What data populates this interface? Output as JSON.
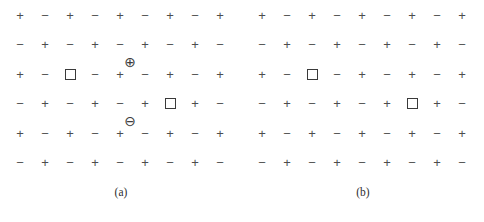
{
  "figure": {
    "background_color": "#ffffff",
    "glyph_color": "#4d4d4d",
    "marker_color": "#3a3a3a",
    "columns": 9,
    "rows": 6,
    "symbols": {
      "plus": "+",
      "minus": "−",
      "square": "□",
      "circled_plus": "⊕",
      "circled_minus": "⊖"
    }
  },
  "panels": [
    {
      "id": "a",
      "caption": "(a)",
      "grid": [
        [
          "+",
          "−",
          "+",
          "−",
          "+",
          "−",
          "+",
          "−",
          "+"
        ],
        [
          "−",
          "+",
          "−",
          "+",
          "−",
          "+",
          "−",
          "+",
          "−"
        ],
        [
          "+",
          "−",
          "□",
          "−",
          "+",
          "−",
          "+",
          "−",
          "+"
        ],
        [
          "−",
          "+",
          "−",
          "+",
          "−",
          "+",
          "□",
          "+",
          "−"
        ],
        [
          "+",
          "−",
          "+",
          "−",
          "+",
          "−",
          "+",
          "−",
          "+"
        ],
        [
          "−",
          "+",
          "−",
          "+",
          "−",
          "+",
          "−",
          "+",
          "−"
        ]
      ],
      "squares": [
        {
          "row": 3,
          "col": 3
        },
        {
          "row": 4,
          "col": 7
        }
      ],
      "defects": [
        {
          "kind": "circled-plus",
          "glyph": "⊕",
          "x": 130,
          "y": 62
        },
        {
          "kind": "circled-minus",
          "glyph": "⊖",
          "x": 130,
          "y": 121
        }
      ]
    },
    {
      "id": "b",
      "caption": "(b)",
      "grid": [
        [
          "+",
          "−",
          "+",
          "−",
          "+",
          "−",
          "+",
          "−",
          "+"
        ],
        [
          "−",
          "+",
          "−",
          "+",
          "−",
          "+",
          "−",
          "+",
          "−"
        ],
        [
          "+",
          "−",
          "□",
          "−",
          "+",
          "−",
          "+",
          "−",
          "+"
        ],
        [
          "−",
          "+",
          "−",
          "+",
          "−",
          "+",
          "□",
          "+",
          "−"
        ],
        [
          "+",
          "−",
          "+",
          "−",
          "+",
          "−",
          "+",
          "−",
          "+"
        ],
        [
          "−",
          "+",
          "−",
          "+",
          "−",
          "+",
          "−",
          "+",
          "−"
        ]
      ],
      "squares": [
        {
          "row": 3,
          "col": 3
        },
        {
          "row": 4,
          "col": 7
        }
      ],
      "defects": []
    }
  ],
  "layout": {
    "panel_width": 242,
    "panel_height": 180,
    "col_start_x": 20,
    "col_step_x": 25,
    "row_start_y": 15,
    "row_step_y": 29.5
  }
}
